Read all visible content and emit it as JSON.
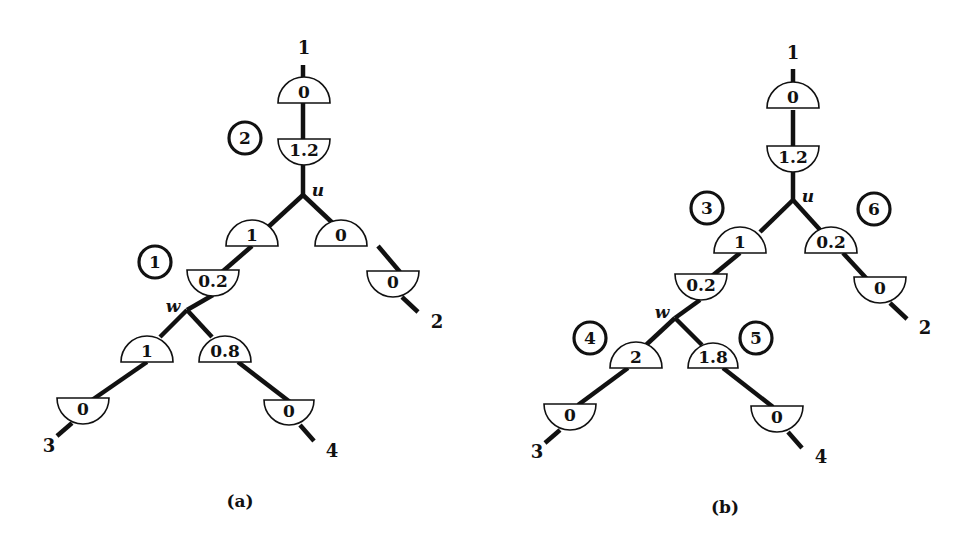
{
  "panels": [
    {
      "id": "a",
      "caption": "(a)",
      "caption_pos": [
        240,
        507
      ],
      "edges": [
        [
          303,
          65,
          303,
          80
        ],
        [
          303,
          103,
          303,
          141
        ],
        [
          303,
          163,
          303,
          195
        ],
        [
          303,
          195,
          265,
          230
        ],
        [
          303,
          195,
          340,
          230
        ],
        [
          252,
          246,
          222,
          272
        ],
        [
          378,
          246,
          400,
          272
        ],
        [
          213,
          295,
          187,
          310
        ],
        [
          187,
          310,
          160,
          337
        ],
        [
          187,
          310,
          212,
          337
        ],
        [
          147,
          362,
          92,
          400
        ],
        [
          238,
          362,
          290,
          402
        ],
        [
          72,
          423,
          57,
          436
        ],
        [
          300,
          425,
          314,
          441
        ],
        [
          402,
          297,
          418,
          312
        ]
      ],
      "semicircles": [
        {
          "cx": 304,
          "base": 103,
          "r": 26,
          "dir": "up",
          "label": "0"
        },
        {
          "cx": 304,
          "base": 139,
          "r": 26,
          "dir": "down",
          "label": "1.2"
        },
        {
          "cx": 252,
          "base": 246,
          "r": 26,
          "dir": "up",
          "label": "1"
        },
        {
          "cx": 341,
          "base": 246,
          "r": 26,
          "dir": "up",
          "label": "0"
        },
        {
          "cx": 213,
          "base": 270,
          "r": 26,
          "dir": "down",
          "label": "0.2"
        },
        {
          "cx": 393,
          "base": 271,
          "r": 26,
          "dir": "down",
          "label": "0"
        },
        {
          "cx": 147,
          "base": 362,
          "r": 26,
          "dir": "up",
          "label": "1"
        },
        {
          "cx": 225,
          "base": 362,
          "r": 26,
          "dir": "up",
          "label": "0.8"
        },
        {
          "cx": 83,
          "base": 398,
          "r": 26,
          "dir": "down",
          "label": "0"
        },
        {
          "cx": 289,
          "base": 400,
          "r": 25,
          "dir": "down",
          "label": "0"
        }
      ],
      "circled_numbers": [
        {
          "cx": 245,
          "cy": 138,
          "label": "2"
        },
        {
          "cx": 155,
          "cy": 262,
          "label": "1"
        }
      ],
      "terminals": [
        {
          "x": 304,
          "y": 54,
          "label": "1"
        },
        {
          "x": 437,
          "y": 328,
          "label": "2"
        },
        {
          "x": 49,
          "y": 452,
          "label": "3"
        },
        {
          "x": 332,
          "y": 457,
          "label": "4"
        }
      ],
      "node_labels": [
        {
          "x": 318,
          "y": 196,
          "label": "u"
        },
        {
          "x": 173,
          "y": 312,
          "label": "w"
        }
      ]
    },
    {
      "id": "b",
      "caption": "(b)",
      "caption_pos": [
        725,
        513
      ],
      "edges": [
        [
          793,
          69,
          793,
          84
        ],
        [
          793,
          110,
          793,
          148
        ],
        [
          793,
          172,
          793,
          200
        ],
        [
          793,
          200,
          760,
          232
        ],
        [
          793,
          200,
          822,
          232
        ],
        [
          740,
          253,
          712,
          276
        ],
        [
          843,
          253,
          867,
          279
        ],
        [
          700,
          300,
          675,
          318
        ],
        [
          675,
          318,
          646,
          345
        ],
        [
          675,
          318,
          702,
          345
        ],
        [
          628,
          368,
          578,
          405
        ],
        [
          723,
          368,
          773,
          407
        ],
        [
          560,
          430,
          545,
          443
        ],
        [
          788,
          432,
          802,
          448
        ],
        [
          890,
          303,
          907,
          319
        ]
      ],
      "semicircles": [
        {
          "cx": 793,
          "base": 108,
          "r": 26,
          "dir": "up",
          "label": "0"
        },
        {
          "cx": 793,
          "base": 146,
          "r": 26,
          "dir": "down",
          "label": "1.2"
        },
        {
          "cx": 740,
          "base": 253,
          "r": 26,
          "dir": "up",
          "label": "1"
        },
        {
          "cx": 831,
          "base": 253,
          "r": 26,
          "dir": "up",
          "label": "0.2"
        },
        {
          "cx": 701,
          "base": 274,
          "r": 26,
          "dir": "down",
          "label": "0.2"
        },
        {
          "cx": 880,
          "base": 277,
          "r": 26,
          "dir": "down",
          "label": "0"
        },
        {
          "cx": 636,
          "base": 368,
          "r": 26,
          "dir": "up",
          "label": "2"
        },
        {
          "cx": 713,
          "base": 368,
          "r": 25,
          "dir": "up",
          "label": "1.8"
        },
        {
          "cx": 570,
          "base": 404,
          "r": 26,
          "dir": "down",
          "label": "0"
        },
        {
          "cx": 777,
          "base": 406,
          "r": 26,
          "dir": "down",
          "label": "0"
        }
      ],
      "circled_numbers": [
        {
          "cx": 707,
          "cy": 208,
          "label": "3"
        },
        {
          "cx": 874,
          "cy": 209,
          "label": "6"
        },
        {
          "cx": 590,
          "cy": 338,
          "label": "4"
        },
        {
          "cx": 756,
          "cy": 338,
          "label": "5"
        }
      ],
      "terminals": [
        {
          "x": 793,
          "y": 59,
          "label": "1"
        },
        {
          "x": 925,
          "y": 334,
          "label": "2"
        },
        {
          "x": 537,
          "y": 458,
          "label": "3"
        },
        {
          "x": 821,
          "y": 463,
          "label": "4"
        }
      ],
      "node_labels": [
        {
          "x": 808,
          "y": 202,
          "label": "u"
        },
        {
          "x": 662,
          "y": 318,
          "label": "w"
        }
      ]
    }
  ]
}
